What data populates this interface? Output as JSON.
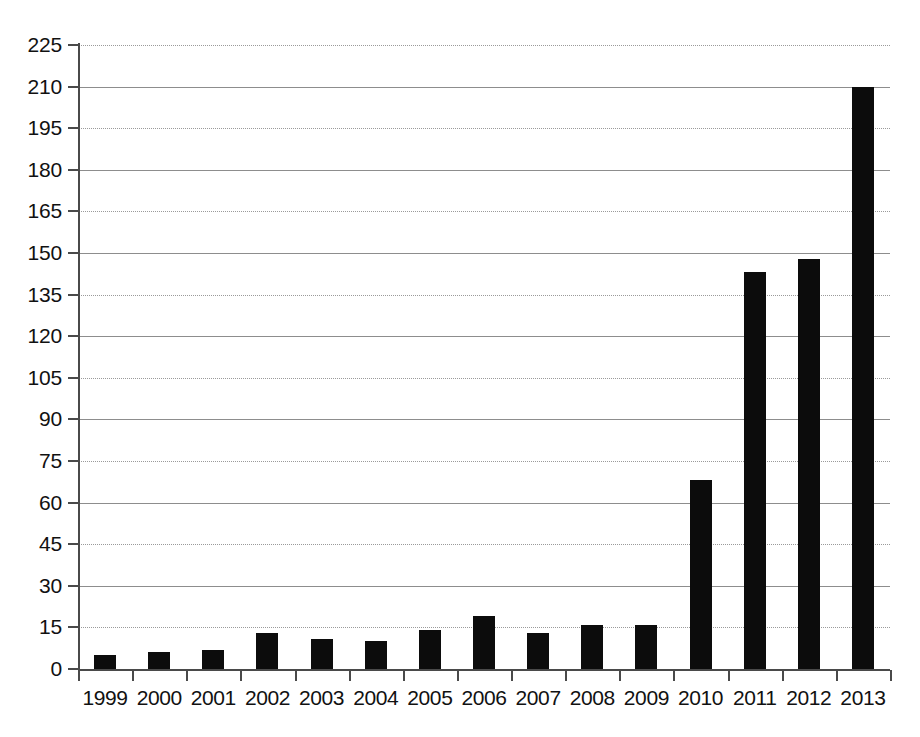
{
  "chart_data": {
    "type": "bar",
    "title": "",
    "subtitle": "",
    "xlabel": "",
    "ylabel": "",
    "categories": [
      "1999",
      "2000",
      "2001",
      "2002",
      "2003",
      "2004",
      "2005",
      "2006",
      "2007",
      "2008",
      "2009",
      "2010",
      "2011",
      "2012",
      "2013"
    ],
    "values": [
      5,
      6,
      7,
      13,
      11,
      10,
      14,
      19,
      13,
      16,
      16,
      68,
      143,
      148,
      210
    ],
    "series": [
      {
        "name": "Publications",
        "values": [
          5,
          6,
          7,
          13,
          11,
          10,
          14,
          19,
          13,
          16,
          16,
          68,
          143,
          148,
          210
        ]
      }
    ],
    "ylim": [
      0,
      225
    ],
    "ytick_values": [
      0,
      15,
      30,
      45,
      60,
      75,
      90,
      105,
      120,
      135,
      150,
      165,
      180,
      195,
      210,
      225
    ],
    "ytick_labels": [
      "0",
      "15",
      "30",
      "45",
      "60",
      "75",
      "90",
      "105",
      "120",
      "135",
      "150",
      "165",
      "180",
      "195",
      "210",
      "225"
    ],
    "grid": true,
    "legend": "none",
    "bar_color": "#0c0c0c",
    "grid_color": "#9a9a9a",
    "axis_color": "#4a4a4a",
    "background_color": "#ffffff"
  }
}
